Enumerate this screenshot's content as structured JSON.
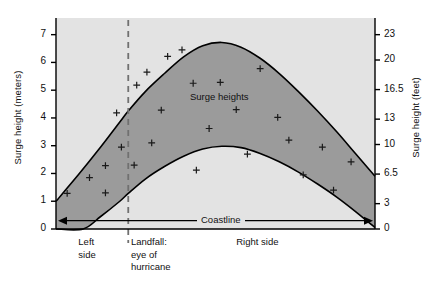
{
  "chart_data": {
    "type": "area",
    "title": "",
    "subtitle": "",
    "ylabel_left": "Surge height (meters)",
    "ylabel_right": "Surge height (feet)",
    "xlabel": "",
    "ylim_left": [
      0,
      7.6
    ],
    "ylim_right": [
      0,
      25
    ],
    "grid": false,
    "legend_position": "none",
    "y_ticks_left": [
      "0",
      "1",
      "2",
      "3",
      "4",
      "5",
      "6",
      "7"
    ],
    "y_tick_values_left": [
      0,
      1,
      2,
      3,
      4,
      5,
      6,
      7
    ],
    "y_ticks_right": [
      "0",
      "3",
      "6.5",
      "10",
      "13",
      "16.5",
      "20",
      "23"
    ],
    "y_tick_values_right": [
      0,
      3,
      6.5,
      10,
      13,
      16.5,
      20,
      23
    ],
    "x_category_labels": [
      {
        "id": "left-side",
        "text": "Left\nside",
        "x_frac": 0.07
      },
      {
        "id": "landfall",
        "text": "Landfall:\neye of\nhurricane",
        "x_frac": 0.235
      },
      {
        "id": "right-side",
        "text": "Right side",
        "x_frac": 0.565
      }
    ],
    "annotations": [
      {
        "id": "surge-heights",
        "text": "Surge heights",
        "x_frac": 0.42,
        "y_value": 4.72
      },
      {
        "id": "coastline",
        "text": "Coastline",
        "x_frac": 0.5,
        "y_value": 0.3,
        "style": "double-arrow-axis"
      }
    ],
    "landfall_line": {
      "x_frac": 0.2265,
      "style": "dashed",
      "color": "#707070"
    },
    "series": [
      {
        "name": "Upper bound (maximum surge height)",
        "points": [
          {
            "x_frac": 0.0,
            "y": 1.0
          },
          {
            "x_frac": 0.07,
            "y": 1.95
          },
          {
            "x_frac": 0.14,
            "y": 2.95
          },
          {
            "x_frac": 0.2,
            "y": 3.85
          },
          {
            "x_frac": 0.2265,
            "y": 4.25
          },
          {
            "x_frac": 0.28,
            "y": 4.95
          },
          {
            "x_frac": 0.34,
            "y": 5.6
          },
          {
            "x_frac": 0.4,
            "y": 6.2
          },
          {
            "x_frac": 0.46,
            "y": 6.6
          },
          {
            "x_frac": 0.52,
            "y": 6.72
          },
          {
            "x_frac": 0.58,
            "y": 6.55
          },
          {
            "x_frac": 0.64,
            "y": 6.15
          },
          {
            "x_frac": 0.7,
            "y": 5.6
          },
          {
            "x_frac": 0.76,
            "y": 4.95
          },
          {
            "x_frac": 0.82,
            "y": 4.25
          },
          {
            "x_frac": 0.88,
            "y": 3.5
          },
          {
            "x_frac": 0.94,
            "y": 2.7
          },
          {
            "x_frac": 1.0,
            "y": 1.9
          }
        ]
      },
      {
        "name": "Lower bound (minimum surge height)",
        "points": [
          {
            "x_frac": 0.0,
            "y": 0.0
          },
          {
            "x_frac": 0.085,
            "y": 0.0
          },
          {
            "x_frac": 0.14,
            "y": 0.45
          },
          {
            "x_frac": 0.2,
            "y": 1.0
          },
          {
            "x_frac": 0.2265,
            "y": 1.28
          },
          {
            "x_frac": 0.28,
            "y": 1.8
          },
          {
            "x_frac": 0.34,
            "y": 2.25
          },
          {
            "x_frac": 0.4,
            "y": 2.62
          },
          {
            "x_frac": 0.46,
            "y": 2.88
          },
          {
            "x_frac": 0.52,
            "y": 2.98
          },
          {
            "x_frac": 0.58,
            "y": 2.93
          },
          {
            "x_frac": 0.64,
            "y": 2.72
          },
          {
            "x_frac": 0.7,
            "y": 2.42
          },
          {
            "x_frac": 0.76,
            "y": 2.05
          },
          {
            "x_frac": 0.82,
            "y": 1.62
          },
          {
            "x_frac": 0.88,
            "y": 1.15
          },
          {
            "x_frac": 0.94,
            "y": 0.62
          },
          {
            "x_frac": 1.0,
            "y": 0.05
          }
        ]
      }
    ],
    "scatter_points": {
      "name": "Observed surge heights",
      "marker": "plus",
      "values": [
        {
          "x_frac": 0.035,
          "y": 1.28
        },
        {
          "x_frac": 0.105,
          "y": 1.85
        },
        {
          "x_frac": 0.155,
          "y": 2.28
        },
        {
          "x_frac": 0.155,
          "y": 1.3
        },
        {
          "x_frac": 0.19,
          "y": 4.18
        },
        {
          "x_frac": 0.205,
          "y": 2.95
        },
        {
          "x_frac": 0.245,
          "y": 2.3
        },
        {
          "x_frac": 0.253,
          "y": 5.18
        },
        {
          "x_frac": 0.285,
          "y": 5.65
        },
        {
          "x_frac": 0.3,
          "y": 3.1
        },
        {
          "x_frac": 0.33,
          "y": 4.28
        },
        {
          "x_frac": 0.35,
          "y": 6.22
        },
        {
          "x_frac": 0.395,
          "y": 6.45
        },
        {
          "x_frac": 0.43,
          "y": 5.25
        },
        {
          "x_frac": 0.44,
          "y": 2.12
        },
        {
          "x_frac": 0.48,
          "y": 3.62
        },
        {
          "x_frac": 0.515,
          "y": 5.28
        },
        {
          "x_frac": 0.565,
          "y": 4.3
        },
        {
          "x_frac": 0.6,
          "y": 2.7
        },
        {
          "x_frac": 0.64,
          "y": 5.78
        },
        {
          "x_frac": 0.695,
          "y": 4.02
        },
        {
          "x_frac": 0.73,
          "y": 3.2
        },
        {
          "x_frac": 0.775,
          "y": 1.95
        },
        {
          "x_frac": 0.835,
          "y": 2.95
        },
        {
          "x_frac": 0.87,
          "y": 1.4
        },
        {
          "x_frac": 0.925,
          "y": 2.42
        }
      ]
    },
    "colors": {
      "plot_background": "#e3e3e3",
      "band_fill": "#9b9b9b",
      "band_outline": "#000000",
      "axis": "#000000",
      "landfall_dash": "#6e6e6e",
      "marker": "#1a1a1a",
      "text": "#111111"
    }
  }
}
